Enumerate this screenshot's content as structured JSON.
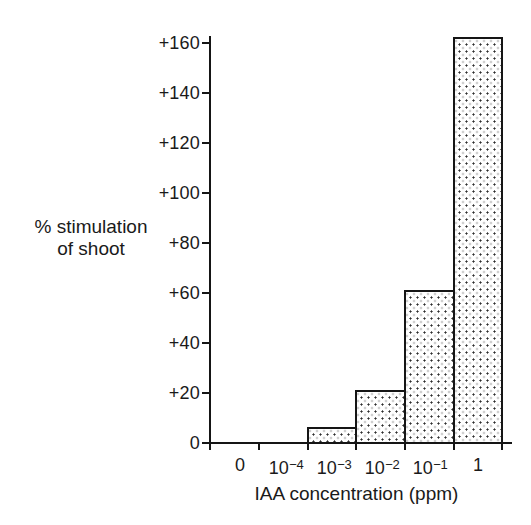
{
  "figure": {
    "y_axis_title_line1": "% stimulation",
    "y_axis_title_line2": "of shoot",
    "x_axis_title": "IAA concentration (ppm)"
  },
  "y_axis": {
    "tick_labels": [
      "0",
      "+20",
      "+40",
      "+60",
      "+80",
      "+100",
      "+120",
      "+140",
      "+160"
    ]
  },
  "x_axis": {
    "ticks": [
      {
        "base": "0",
        "exp": ""
      },
      {
        "base": "10",
        "exp": "−4"
      },
      {
        "base": "10",
        "exp": "−3"
      },
      {
        "base": "10",
        "exp": "−2"
      },
      {
        "base": "10",
        "exp": "−1"
      },
      {
        "base": "1",
        "exp": ""
      }
    ]
  },
  "chart_data": {
    "type": "bar",
    "title": "",
    "xlabel": "IAA concentration (ppm)",
    "ylabel": "% stimulation of shoot",
    "categories": [
      "0",
      "10^-4",
      "10^-3",
      "10^-2",
      "10^-1",
      "1"
    ],
    "values": [
      0,
      0,
      5,
      20,
      60,
      161
    ],
    "y_ticks": [
      0,
      20,
      40,
      60,
      80,
      100,
      120,
      140,
      160
    ],
    "ylim": [
      0,
      168
    ],
    "x_scale": "logarithmic bins (ppm); leftmost bin is 0 control",
    "grid": false,
    "legend": null,
    "bar_fill": "white with fine dark stipple dots",
    "bar_outline": "#151515"
  },
  "style": {
    "ink": "#151515",
    "background": "#ffffff"
  }
}
